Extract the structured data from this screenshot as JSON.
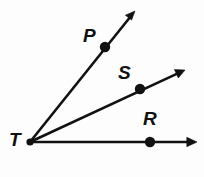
{
  "figure": {
    "width": 204,
    "height": 177,
    "background_color": "#fdfdfd",
    "stroke_color": "#111111",
    "vertex": {
      "name": "T",
      "label": "T",
      "x": 30,
      "y": 142,
      "label_x": 9,
      "label_y": 130
    },
    "points": [
      {
        "name": "P",
        "label": "P",
        "x": 105,
        "y": 47,
        "label_x": 83,
        "label_y": 26
      },
      {
        "name": "S",
        "label": "S",
        "x": 140,
        "y": 89,
        "label_x": 118,
        "label_y": 63
      },
      {
        "name": "R",
        "label": "R",
        "x": 150,
        "y": 142,
        "label_x": 143,
        "label_y": 109
      }
    ],
    "rays": [
      {
        "name": "ray-TP",
        "from": "T",
        "through": "P",
        "tip_x": 135,
        "tip_y": 11
      },
      {
        "name": "ray-TS",
        "from": "T",
        "through": "S",
        "tip_x": 185,
        "tip_y": 70
      },
      {
        "name": "ray-TR",
        "from": "T",
        "through": "R",
        "tip_x": 197,
        "tip_y": 142
      }
    ]
  }
}
